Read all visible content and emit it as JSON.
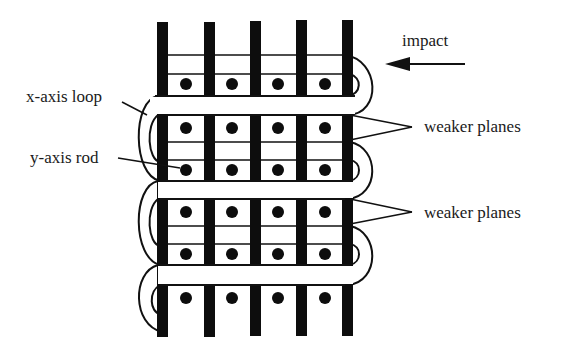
{
  "diagram": {
    "labels": {
      "impact": "impact",
      "x_axis_loop": "x-axis loop",
      "y_axis_rod": "y-axis rod",
      "weaker_planes_1": "weaker planes",
      "weaker_planes_2": "weaker planes"
    },
    "colors": {
      "ink": "#0d0d0d",
      "background": "#ffffff"
    },
    "rods_count": 5,
    "dot_rows": 5,
    "dots_per_row": 4,
    "loops": 3
  }
}
